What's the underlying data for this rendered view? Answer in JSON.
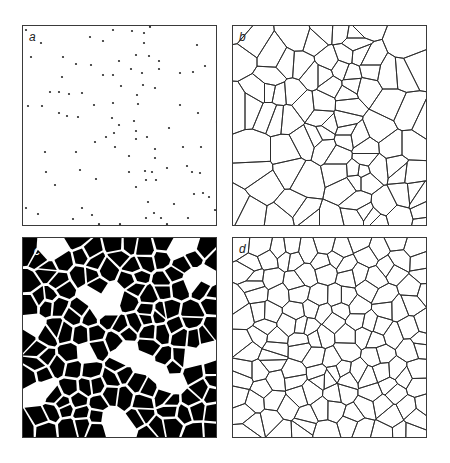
{
  "figure": {
    "panels": [
      {
        "id": "a",
        "label": "a",
        "type": "point-pattern"
      },
      {
        "id": "b",
        "label": "b",
        "type": "voronoi-tessellation"
      },
      {
        "id": "c",
        "label": "c",
        "type": "filled-cell-pattern"
      },
      {
        "id": "d",
        "label": "d",
        "type": "cell-boundary-network"
      }
    ],
    "colors": {
      "ink": "#2a2a2a",
      "fill": "#000000",
      "background": "#ffffff"
    }
  },
  "points_a": [
    [
      3,
      4
    ],
    [
      67,
      11
    ],
    [
      90,
      4
    ],
    [
      109,
      5
    ],
    [
      121,
      7
    ],
    [
      127,
      1
    ],
    [
      18,
      17
    ],
    [
      80,
      15
    ],
    [
      121,
      17
    ],
    [
      174,
      19
    ],
    [
      8,
      31
    ],
    [
      40,
      31
    ],
    [
      113,
      29
    ],
    [
      126,
      30
    ],
    [
      136,
      35
    ],
    [
      96,
      35
    ],
    [
      53,
      38
    ],
    [
      68,
      39
    ],
    [
      182,
      40
    ],
    [
      108,
      43
    ],
    [
      136,
      43
    ],
    [
      157,
      47
    ],
    [
      170,
      46
    ],
    [
      119,
      47
    ],
    [
      80,
      49
    ],
    [
      90,
      49
    ],
    [
      39,
      51
    ],
    [
      98,
      60
    ],
    [
      120,
      59
    ],
    [
      132,
      62
    ],
    [
      27,
      66
    ],
    [
      36,
      66
    ],
    [
      46,
      68
    ],
    [
      59,
      67
    ],
    [
      114,
      69
    ],
    [
      5,
      80
    ],
    [
      19,
      80
    ],
    [
      71,
      79
    ],
    [
      90,
      77
    ],
    [
      115,
      78
    ],
    [
      157,
      79
    ],
    [
      36,
      87
    ],
    [
      44,
      90
    ],
    [
      55,
      91
    ],
    [
      175,
      87
    ],
    [
      89,
      92
    ],
    [
      111,
      95
    ],
    [
      194,
      96
    ],
    [
      96,
      99
    ],
    [
      146,
      102
    ],
    [
      113,
      105
    ],
    [
      91,
      107
    ],
    [
      83,
      111
    ],
    [
      124,
      111
    ],
    [
      113,
      113
    ],
    [
      72,
      116
    ],
    [
      92,
      121
    ],
    [
      160,
      121
    ],
    [
      178,
      121
    ],
    [
      132,
      123
    ],
    [
      22,
      126
    ],
    [
      53,
      126
    ],
    [
      132,
      132
    ],
    [
      106,
      130
    ],
    [
      144,
      142
    ],
    [
      164,
      140
    ],
    [
      57,
      144
    ],
    [
      23,
      146
    ],
    [
      106,
      146
    ],
    [
      122,
      145
    ],
    [
      129,
      146
    ],
    [
      169,
      146
    ],
    [
      177,
      147
    ],
    [
      73,
      153
    ],
    [
      123,
      154
    ],
    [
      133,
      154
    ],
    [
      32,
      159
    ],
    [
      113,
      161
    ],
    [
      171,
      168
    ],
    [
      180,
      167
    ],
    [
      186,
      171
    ],
    [
      125,
      176
    ],
    [
      151,
      178
    ],
    [
      3,
      182
    ],
    [
      59,
      182
    ],
    [
      192,
      184
    ],
    [
      15,
      188
    ],
    [
      69,
      189
    ],
    [
      131,
      187
    ],
    [
      50,
      193
    ],
    [
      123,
      192
    ],
    [
      138,
      192
    ],
    [
      165,
      192
    ],
    [
      76,
      198
    ],
    [
      97,
      198
    ],
    [
      144,
      198
    ],
    [
      194,
      199
    ]
  ],
  "seeds_c": {
    "count": 150,
    "seed": 7,
    "gap": 1.6,
    "holes": [
      [
        28,
        10
      ],
      [
        160,
        8
      ],
      [
        12,
        90
      ],
      [
        80,
        60
      ],
      [
        140,
        140
      ],
      [
        20,
        150
      ],
      [
        95,
        185
      ],
      [
        175,
        120
      ],
      [
        60,
        110
      ],
      [
        180,
        35
      ],
      [
        110,
        120
      ]
    ],
    "hole_radius": 13
  },
  "seeds_d": {
    "count": 135,
    "seed": 23
  }
}
